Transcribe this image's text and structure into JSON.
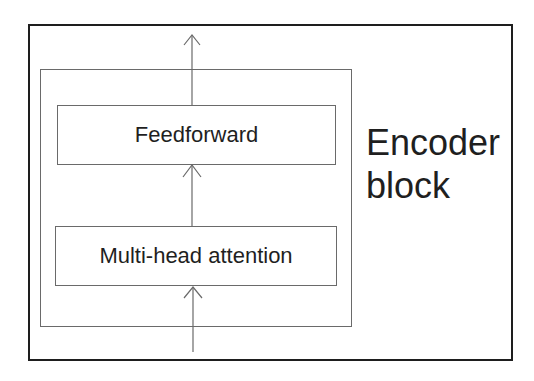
{
  "diagram": {
    "title_line1": "Encoder",
    "title_line2": "block",
    "boxes": [
      {
        "id": "feedforward",
        "label": "Feedforward"
      },
      {
        "id": "multi-head-attention",
        "label": "Multi-head attention"
      }
    ],
    "arrows": [
      {
        "from": "input",
        "to": "multi-head-attention"
      },
      {
        "from": "multi-head-attention",
        "to": "feedforward"
      },
      {
        "from": "feedforward",
        "to": "output"
      }
    ],
    "colors": {
      "outer_border": "#1e1e1e",
      "inner_border": "#6a6a6a",
      "text": "#1f1f1f"
    }
  }
}
